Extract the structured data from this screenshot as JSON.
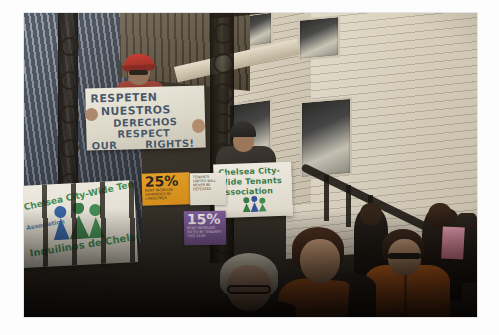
{
  "image": {
    "kind": "photograph",
    "scene_title": "Tenants rights rally on a house porch",
    "border_color": "#ffffff",
    "frame": {
      "left": 24,
      "top": 13,
      "width": 453,
      "height": 304
    }
  },
  "signs": {
    "main_protest_sign": {
      "line1": "RESPETEN",
      "line2": "NUESTROS",
      "line3": "DERECHOS",
      "line4": "RESPECT",
      "line5_left": "OUR",
      "line5_right": "RIGHTS!",
      "text_color": "#3a4f66",
      "accent_color": "#2f7a46"
    },
    "chelsea_sign": {
      "line1": "Chelsea City-",
      "line2": "Wide Tenants",
      "line3": "Association",
      "text_color": "#2f7a46"
    },
    "banner": {
      "line1": "Chelsea City-Wide Tenants",
      "line2": "Association",
      "line3": "Inquilinos de Chelsea",
      "text_color": "#3a8b52",
      "sub_color": "#3f7fb0"
    },
    "poster_orange": {
      "percent": "25%",
      "body": "RENT INCREASE DEMANDED BY LANDLORDS",
      "background": "#e8a020"
    },
    "poster_purple": {
      "percent": "15%",
      "body": "RENT INCREASE FACED BY TENANTS THIS YEAR",
      "background": "#7e5aa0"
    },
    "poster_white": {
      "body": "TENANTS UNITED WILL NEVER BE DEFEATED",
      "background": "#f2f0e8"
    }
  },
  "people": {
    "man_red_cap": "protester-with-red-cap-and-sunglasses",
    "sign_holder": "protester-holding-chelsea-sign",
    "front_woman_glasses": "seated-woman-with-glasses",
    "front_woman_shawl": "seated-woman-with-orange-shawl",
    "orange_jacket": "person-in-orange-jacket",
    "back_figures": "background-attendees"
  },
  "architecture": {
    "left_wall": "blue-grey-clapboard-siding",
    "right_wall": "cream-clapboard-siding",
    "ironwork": "ornate-wrought-iron-porch-column",
    "windows": 4
  },
  "colors": {
    "siding_left": "#6d7b90",
    "siding_right": "#ded7c7",
    "iron": "#120e0a",
    "orange_jacket": "#e8731f",
    "shawl": "#c4621f",
    "pink_flyer": "#efa3bc"
  }
}
